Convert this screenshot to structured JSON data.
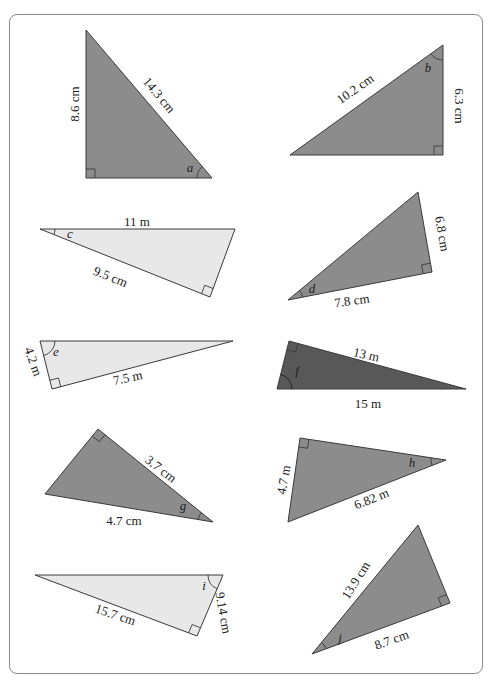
{
  "colors": {
    "dark": "#8c8c8c",
    "darker": "#585858",
    "light": "#e8e8e8",
    "stroke": "#3a3a3a",
    "frame": "#8a8a8a"
  },
  "triangles": [
    {
      "id": "a",
      "angle_label": "a",
      "points": [
        [
          86,
          30
        ],
        [
          86,
          178
        ],
        [
          212,
          178
        ]
      ],
      "fill": "dark",
      "right_angle_at": [
        86,
        178
      ],
      "ra_dir": [
        1,
        -1
      ],
      "sides": [
        {
          "text": "8.6 cm",
          "x": 76,
          "y": 104,
          "rotate": -90
        },
        {
          "text": "14.3 cm",
          "x": 158,
          "y": 96,
          "rotate": 50
        }
      ],
      "angle_pos": [
        190,
        172
      ]
    },
    {
      "id": "b",
      "angle_label": "b",
      "points": [
        [
          443,
          45
        ],
        [
          443,
          155
        ],
        [
          290,
          155
        ]
      ],
      "fill": "dark",
      "right_angle_at": [
        443,
        155
      ],
      "ra_dir": [
        -1,
        -1
      ],
      "sides": [
        {
          "text": "10.2 cm",
          "x": 356,
          "y": 90,
          "rotate": -35
        },
        {
          "text": "6.3 cm",
          "x": 458,
          "y": 106,
          "rotate": 90
        }
      ],
      "angle_pos": [
        428,
        72
      ]
    },
    {
      "id": "c",
      "angle_label": "c",
      "points": [
        [
          40,
          229
        ],
        [
          235,
          229
        ],
        [
          210,
          297
        ]
      ],
      "fill": "light",
      "right_angle_at": [
        210,
        297
      ],
      "ra_dir": [
        -1,
        -1
      ],
      "sides": [
        {
          "text": "11 m",
          "x": 137,
          "y": 223,
          "rotate": 0
        },
        {
          "text": "9.5 cm",
          "x": 110,
          "y": 278,
          "rotate": 22
        }
      ],
      "angle_pos": [
        70,
        238
      ]
    },
    {
      "id": "d",
      "angle_label": "d",
      "points": [
        [
          288,
          300
        ],
        [
          418,
          192
        ],
        [
          432,
          272
        ]
      ],
      "fill": "dark",
      "right_angle_at": [
        432,
        272
      ],
      "ra_dir": [
        -1,
        -1
      ],
      "sides": [
        {
          "text": "6.8 cm",
          "x": 441,
          "y": 234,
          "rotate": 80
        },
        {
          "text": "7.8 cm",
          "x": 352,
          "y": 302,
          "rotate": -8
        }
      ],
      "angle_pos": [
        312,
        293
      ]
    },
    {
      "id": "e",
      "angle_label": "e",
      "points": [
        [
          40,
          341
        ],
        [
          233,
          341
        ],
        [
          52,
          389
        ]
      ],
      "fill": "light",
      "right_angle_at": [
        52,
        389
      ],
      "ra_dir": [
        1,
        -1
      ],
      "sides": [
        {
          "text": "4.2 m",
          "x": 32,
          "y": 362,
          "rotate": 70
        },
        {
          "text": "7.5 m",
          "x": 128,
          "y": 379,
          "rotate": -12
        }
      ],
      "angle_pos": [
        56,
        356
      ]
    },
    {
      "id": "f",
      "angle_label": "f",
      "points": [
        [
          289,
          341
        ],
        [
          466,
          389
        ],
        [
          277,
          389
        ]
      ],
      "fill": "darker",
      "right_angle_at": [
        289,
        341
      ],
      "ra_dir": [
        1,
        1
      ],
      "sides": [
        {
          "text": "13 m",
          "x": 366,
          "y": 356,
          "rotate": 13
        },
        {
          "text": "15 m",
          "x": 368,
          "y": 405,
          "rotate": 0
        }
      ],
      "angle_pos": [
        297,
        375
      ]
    },
    {
      "id": "g",
      "angle_label": "g",
      "points": [
        [
          98,
          429
        ],
        [
          213,
          522
        ],
        [
          45,
          494
        ]
      ],
      "fill": "dark",
      "right_angle_at": [
        98,
        429
      ],
      "ra_dir": [
        -1,
        1
      ],
      "sides": [
        {
          "text": "3.7 cm",
          "x": 160,
          "y": 470,
          "rotate": 38
        },
        {
          "text": "4.7 cm",
          "x": 124,
          "y": 522,
          "rotate": 0
        }
      ],
      "angle_pos": [
        183,
        510
      ]
    },
    {
      "id": "h",
      "angle_label": "h",
      "points": [
        [
          300,
          438
        ],
        [
          446,
          460
        ],
        [
          288,
          522
        ]
      ],
      "fill": "dark",
      "right_angle_at": [
        300,
        438
      ],
      "ra_dir": [
        -1,
        1
      ],
      "sides": [
        {
          "text": "4.7 m",
          "x": 285,
          "y": 480,
          "rotate": -80
        },
        {
          "text": "6.82 m",
          "x": 372,
          "y": 500,
          "rotate": -22
        }
      ],
      "angle_pos": [
        412,
        467
      ]
    },
    {
      "id": "i",
      "angle_label": "i",
      "points": [
        [
          35,
          575
        ],
        [
          223,
          575
        ],
        [
          197,
          636
        ]
      ],
      "fill": "light",
      "right_angle_at": [
        197,
        636
      ],
      "ra_dir": [
        -1,
        -1
      ],
      "sides": [
        {
          "text": "15.7 cm",
          "x": 115,
          "y": 616,
          "rotate": 18
        },
        {
          "text": "9.14 cm",
          "x": 222,
          "y": 613,
          "rotate": 80
        }
      ],
      "angle_pos": [
        204,
        590
      ]
    },
    {
      "id": "j",
      "angle_label": "j",
      "points": [
        [
          312,
          654
        ],
        [
          418,
          525
        ],
        [
          450,
          603
        ]
      ],
      "fill": "dark",
      "right_angle_at": [
        450,
        603
      ],
      "ra_dir": [
        -1,
        -1
      ],
      "sides": [
        {
          "text": "13.9 cm",
          "x": 357,
          "y": 581,
          "rotate": -58
        },
        {
          "text": "8.7 cm",
          "x": 392,
          "y": 641,
          "rotate": -20
        }
      ],
      "angle_pos": [
        340,
        642
      ]
    }
  ]
}
